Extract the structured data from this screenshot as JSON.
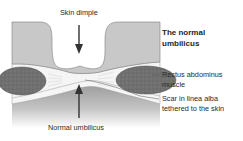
{
  "diagram": {
    "title_line1": "The normal",
    "title_line2": "umbilicus",
    "labels": {
      "top": "Skin dimple",
      "bottom": "Normal umbilicus",
      "rectus_line1": "Rectus abdominus",
      "rectus_line2": "muscle",
      "scar_line1": "Scar in linea alba",
      "scar_line2": "tethered to the skin"
    },
    "colors": {
      "skin": "#c9c9c9",
      "skin_edge": "#8a8a8a",
      "fascia": "#f4f4f4",
      "muscle": "#6f6f6f",
      "muscle_edge": "#4a4a4a",
      "deep": "#a8a8a8",
      "arrow": "#333333",
      "text": "#2a2a2a"
    }
  }
}
